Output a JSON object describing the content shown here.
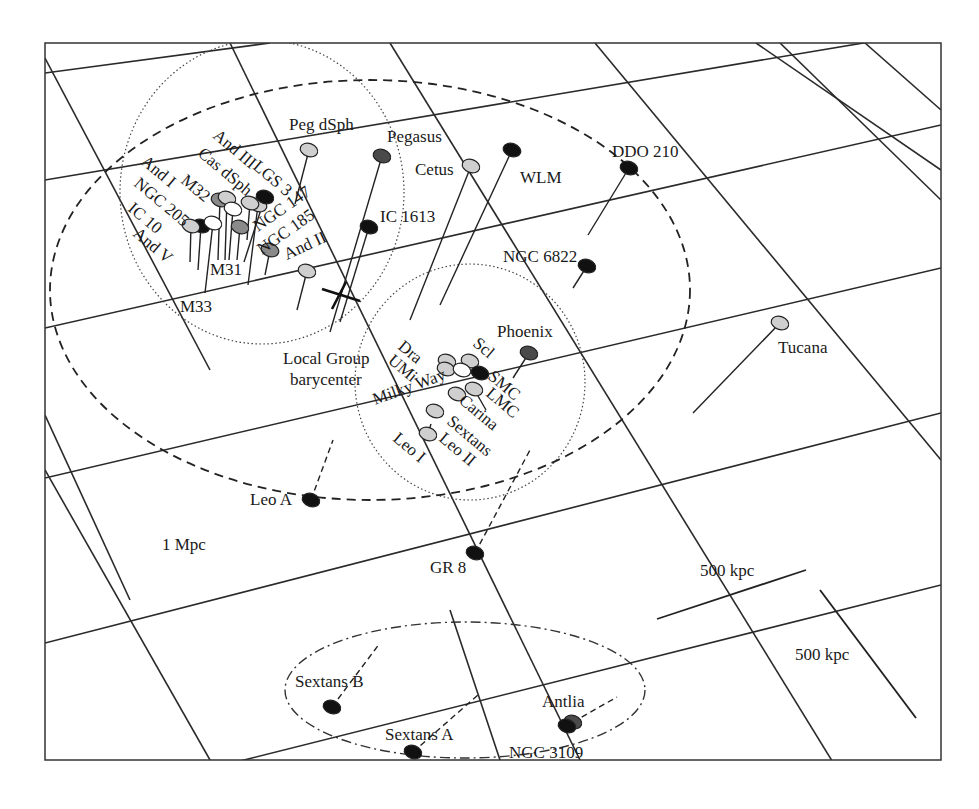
{
  "diagram": {
    "frame": {
      "x": 45,
      "y": 43,
      "w": 896,
      "h": 717
    },
    "colors": {
      "black": "#111111",
      "dark": "#4a4a4a",
      "mid": "#8a8a8a",
      "light": "#cfcfcf",
      "white": "#ffffff"
    },
    "rings": {
      "m31_subgroup": {
        "style": "dotted",
        "cx": 262,
        "cy": 192,
        "rx": 142,
        "ry": 152
      },
      "mw_subgroup": {
        "style": "dotted",
        "cx": 470,
        "cy": 382,
        "rx": 115,
        "ry": 118
      },
      "one_mpc": {
        "style": "dashed",
        "cx": 370,
        "cy": 290,
        "rx": 320,
        "ry": 210,
        "label": "1 Mpc"
      },
      "antlia_sextans": {
        "style": "dash-dot",
        "cx": 465,
        "cy": 680,
        "rx": 180,
        "ry": 68
      }
    },
    "labels": {
      "barycenter_line1": "Local Group",
      "barycenter_line2": "barycenter",
      "one_mpc": "1 Mpc",
      "scale_horizontal": "500 kpc",
      "scale_vertical": "500 kpc"
    },
    "galaxies": [
      {
        "name": "Peg dSph",
        "x": 309,
        "y": 150,
        "fill": "light",
        "stem_to": [
          295,
          204
        ],
        "lx": 289,
        "ly": 130,
        "rot": 0
      },
      {
        "name": "Pegasus",
        "x": 382,
        "y": 156,
        "fill": "dark",
        "stem_to": [
          330,
          332
        ],
        "lx": 387,
        "ly": 142,
        "rot": 0
      },
      {
        "name": "Cetus",
        "x": 471,
        "y": 166,
        "fill": "light",
        "stem_to": [
          410,
          320
        ],
        "lx": 415,
        "ly": 175,
        "rot": 0
      },
      {
        "name": "WLM",
        "x": 512,
        "y": 150,
        "fill": "black",
        "stem_to": [
          440,
          305
        ],
        "lx": 520,
        "ly": 183,
        "rot": 0
      },
      {
        "name": "DDO 210",
        "x": 629,
        "y": 168,
        "fill": "black",
        "stem_to": [
          588,
          235
        ],
        "lx": 612,
        "ly": 157,
        "rot": 0
      },
      {
        "name": "IC 1613",
        "x": 369,
        "y": 227,
        "fill": "black",
        "stem_to": [
          340,
          322
        ],
        "lx": 380,
        "ly": 222,
        "rot": 0
      },
      {
        "name": "NGC 6822",
        "x": 587,
        "y": 266,
        "fill": "black",
        "stem_to": [
          573,
          288
        ],
        "lx": 503,
        "ly": 262,
        "rot": 0
      },
      {
        "name": "Tucana",
        "x": 780,
        "y": 323,
        "fill": "light",
        "stem_to": [
          693,
          413
        ],
        "lx": 778,
        "ly": 353,
        "rot": 0
      },
      {
        "name": "Phoenix",
        "x": 529,
        "y": 353,
        "fill": "dark",
        "stem_to": [
          513,
          378
        ],
        "lx": 497,
        "ly": 337,
        "rot": 0
      },
      {
        "name": "Leo A",
        "x": 311,
        "y": 500,
        "fill": "black",
        "stem_to": [
          333,
          440
        ],
        "dashed": true,
        "lx": 250,
        "ly": 505,
        "rot": 0
      },
      {
        "name": "GR 8",
        "x": 475,
        "y": 553,
        "fill": "black",
        "stem_to": [
          530,
          450
        ],
        "dashed": true,
        "lx": 430,
        "ly": 573,
        "rot": 0
      },
      {
        "name": "Sextans B",
        "x": 332,
        "y": 707,
        "fill": "black",
        "stem_to": [
          380,
          643
        ],
        "dashed": true,
        "lx": 295,
        "ly": 687,
        "rot": 0
      },
      {
        "name": "Sextans A",
        "x": 413,
        "y": 752,
        "fill": "black",
        "stem_to": [
          478,
          695
        ],
        "dashed": true,
        "lx": 385,
        "ly": 740,
        "rot": 0
      },
      {
        "name": "Antlia",
        "x": 573,
        "y": 722,
        "fill": "dark",
        "stem_to": [
          617,
          697
        ],
        "dashed": true,
        "lx": 542,
        "ly": 707,
        "rot": 0
      },
      {
        "name": "NGC 3109",
        "x": 567,
        "y": 726,
        "fill": "black",
        "stem_to": null,
        "lx": 509,
        "ly": 758,
        "rot": 0
      },
      {
        "name": "M33",
        "x": 0,
        "y": 0,
        "fill": "none",
        "stem_to": null,
        "lx": 180,
        "ly": 312,
        "rot": 0
      },
      {
        "name": "M31",
        "x": 0,
        "y": 0,
        "fill": "none",
        "stem_to": null,
        "lx": 210,
        "ly": 275,
        "rot": 0
      },
      {
        "name": "And II",
        "x": 307,
        "y": 271,
        "fill": "light",
        "stem_to": [
          297,
          310
        ],
        "lx": 287,
        "ly": 260,
        "rot": -25
      },
      {
        "name": "NGC 185",
        "x": 270,
        "y": 250,
        "fill": "mid",
        "stem_to": [
          265,
          275
        ],
        "lx": 262,
        "ly": 255,
        "rot": -35
      },
      {
        "name": "NGC 147",
        "x": 258,
        "y": 205,
        "fill": "light",
        "stem_to": [
          248,
          285
        ],
        "lx": 258,
        "ly": 232,
        "rot": -35
      },
      {
        "name": "LGS 3",
        "x": 0,
        "y": 0,
        "fill": "none",
        "stem_to": null,
        "lx": 252,
        "ly": 168,
        "rot": 40
      },
      {
        "name": "And III",
        "x": 265,
        "y": 197,
        "fill": "black",
        "stem_to": [
          244,
          262
        ],
        "lx": 212,
        "ly": 137,
        "rot": 40
      },
      {
        "name": "Cas dSph",
        "x": 250,
        "y": 203,
        "fill": "light",
        "stem_to": [
          247,
          240
        ],
        "lx": 197,
        "ly": 155,
        "rot": 40
      },
      {
        "name": "And I",
        "x": 220,
        "y": 200,
        "fill": "mid",
        "stem_to": [
          218,
          260
        ],
        "lx": 140,
        "ly": 163,
        "rot": 40
      },
      {
        "name": "M32",
        "x": 227,
        "y": 198,
        "fill": "light",
        "stem_to": [
          225,
          260
        ],
        "lx": 180,
        "ly": 182,
        "rot": 40
      },
      {
        "name": "NGC 205",
        "x": 233,
        "y": 209,
        "fill": "white",
        "stem_to": [
          229,
          260
        ],
        "lx": 133,
        "ly": 185,
        "rot": 40
      },
      {
        "name": "IC 10",
        "x": 201,
        "y": 226,
        "fill": "black",
        "stem_to": [
          198,
          270
        ],
        "lx": 127,
        "ly": 210,
        "rot": 40
      },
      {
        "name": "And V",
        "x": 191,
        "y": 226,
        "fill": "light",
        "stem_to": [
          190,
          262
        ],
        "lx": 132,
        "ly": 235,
        "rot": 40
      },
      {
        "name": "M31 core",
        "x": 213,
        "y": 223,
        "fill": "white",
        "stem_to": [
          205,
          293
        ],
        "lx": 0,
        "ly": 0,
        "rot": 0
      },
      {
        "name": "M31 disk",
        "x": 240,
        "y": 227,
        "fill": "mid",
        "stem_to": [
          237,
          260
        ],
        "lx": 0,
        "ly": 0,
        "rot": 0
      },
      {
        "name": "Dra",
        "x": 447,
        "y": 361,
        "fill": "light",
        "stem_to": null,
        "lx": 397,
        "ly": 348,
        "rot": 40
      },
      {
        "name": "UMi",
        "x": 446,
        "y": 369,
        "fill": "light",
        "stem_to": null,
        "lx": 387,
        "ly": 362,
        "rot": 40
      },
      {
        "name": "Scl",
        "x": 470,
        "y": 361,
        "fill": "light",
        "stem_to": null,
        "lx": 472,
        "ly": 345,
        "rot": 40
      },
      {
        "name": "Milky Way",
        "x": 462,
        "y": 370,
        "fill": "white",
        "stem_to": null,
        "lx": 375,
        "ly": 405,
        "rot": -20
      },
      {
        "name": "SMC",
        "x": 480,
        "y": 373,
        "fill": "black",
        "stem_to": null,
        "lx": 487,
        "ly": 378,
        "rot": 40
      },
      {
        "name": "LMC",
        "x": 474,
        "y": 389,
        "fill": "light",
        "stem_to": [
          486,
          410
        ],
        "lx": 485,
        "ly": 395,
        "rot": 40
      },
      {
        "name": "Carina",
        "x": 457,
        "y": 394,
        "fill": "light",
        "stem_to": null,
        "lx": 458,
        "ly": 402,
        "rot": 40
      },
      {
        "name": "Sextans",
        "x": 435,
        "y": 411,
        "fill": "light",
        "stem_to": null,
        "lx": 446,
        "ly": 423,
        "rot": 40
      },
      {
        "name": "Leo II",
        "x": 428,
        "y": 434,
        "fill": "light",
        "stem_to": [
          431,
          424
        ],
        "lx": 438,
        "ly": 440,
        "rot": 40
      },
      {
        "name": "Leo I",
        "x": 0,
        "y": 0,
        "fill": "none",
        "stem_to": null,
        "lx": 392,
        "ly": 440,
        "rot": 40
      }
    ],
    "barycenter": {
      "x": 340,
      "y": 297
    },
    "scale_bars": {
      "horizontal": {
        "x1": 657,
        "y1": 619,
        "x2": 806,
        "y2": 570,
        "lx": 700,
        "ly": 577
      },
      "vertical": {
        "x1": 820,
        "y1": 590,
        "x2": 916,
        "y2": 718,
        "lx": 795,
        "ly": 658
      }
    }
  }
}
